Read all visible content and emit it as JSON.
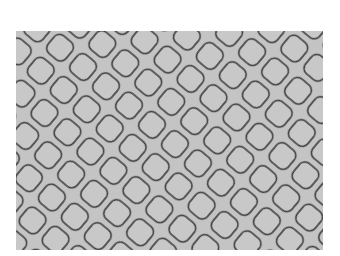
{
  "image": {
    "description": "Grayscale texture of rounded diamond-shaped scales or cobblestones outlined in dark gray on a light gray background",
    "background_color": "#ffffff",
    "fill_color": "#c4c4c4",
    "outline_color": "#3a3a3a"
  }
}
